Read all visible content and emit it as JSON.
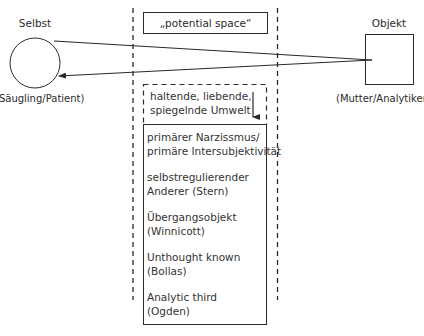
{
  "left_node": {
    "title": "Selbst",
    "caption": "(Säugling/Patient)",
    "shape": "circle"
  },
  "right_node": {
    "title": "Objekt",
    "caption": "(Mutter/Analytiker)",
    "shape": "square"
  },
  "center": {
    "top_label": "„potential space“",
    "environment_line1": "haltende, liebende,",
    "environment_line2": "spiegelnde Umwelt",
    "concepts": [
      {
        "line1": "primärer Narzissmus/",
        "line2": "primäre Intersubjektivität"
      },
      {
        "line1": "selbstregulierender",
        "line2": "Anderer (Stern)"
      },
      {
        "line1": "Übergangsobjekt",
        "line2": "(Winnicott)"
      },
      {
        "line1": "Unthought known",
        "line2": "(Bollas)"
      },
      {
        "line1": "Analytic third",
        "line2": "(Ogden)"
      }
    ]
  },
  "colors": {
    "stroke": "#2a2a2a",
    "background": "#ffffff"
  }
}
